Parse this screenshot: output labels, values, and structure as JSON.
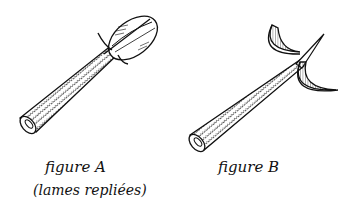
{
  "figures": [
    {
      "id": "A",
      "title": "figure A",
      "subtitle": "(lames repliées)",
      "description": "handle with blades folded into an oval head"
    },
    {
      "id": "B",
      "title": "figure B",
      "description": "handle with two crescent blades opened"
    }
  ],
  "colors": {
    "ink": "#111111",
    "background": "#ffffff"
  }
}
